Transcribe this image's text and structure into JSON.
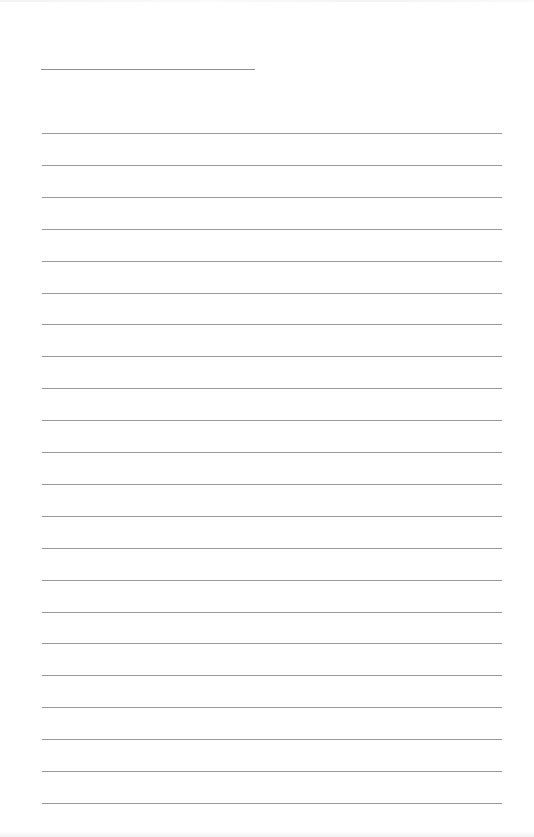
{
  "page": {
    "type": "lined-paper",
    "background_color": "#ffffff",
    "line_color": "#9a9a9a",
    "title_line": {
      "x": 41,
      "y": 69,
      "width": 214
    },
    "ruled_lines": {
      "count": 22,
      "start_y": 133,
      "spacing": 31.9,
      "x": 42,
      "width": 460
    }
  }
}
